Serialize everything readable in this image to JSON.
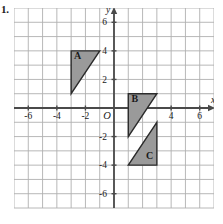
{
  "problem": {
    "number": "1."
  },
  "graph": {
    "type": "coordinate-plane",
    "origin_label": "O",
    "axis_labels": {
      "x": "x",
      "y": "y"
    },
    "x_axis": {
      "min": -7,
      "max": 7,
      "tick_labels": [
        "-6",
        "-4",
        "-2",
        "4",
        "6"
      ],
      "tick_values": [
        -6,
        -4,
        -2,
        4,
        6
      ],
      "hidden_tick_values": [
        2
      ]
    },
    "y_axis": {
      "min": -7,
      "max": 7,
      "tick_labels": [
        "6",
        "4",
        "2",
        "-2",
        "-4",
        "-6"
      ],
      "tick_values": [
        6,
        4,
        2,
        -2,
        -4,
        -6
      ]
    },
    "grid": {
      "visible": true,
      "spacing": 1,
      "color": "#b0b0b0"
    },
    "colors": {
      "grid": "#b0b0b0",
      "axis": "#4a4a4a",
      "shape_fill": "#9a9a9a",
      "shape_stroke": "#2b2b2b",
      "text": "#1a1a1a"
    },
    "shapes": [
      {
        "label": "A",
        "kind": "right-triangle",
        "vertices": [
          [
            -3,
            4
          ],
          [
            -1,
            4
          ],
          [
            -3,
            1
          ]
        ],
        "label_position": [
          -2.55,
          3.45
        ]
      },
      {
        "label": "B",
        "kind": "right-triangle",
        "vertices": [
          [
            1,
            1
          ],
          [
            3,
            1
          ],
          [
            1,
            -2
          ]
        ],
        "label_position": [
          1.45,
          0.45
        ]
      },
      {
        "label": "C",
        "kind": "right-triangle",
        "vertices": [
          [
            3,
            -1
          ],
          [
            3,
            -4
          ],
          [
            1,
            -4
          ]
        ],
        "label_position": [
          2.5,
          -3.55
        ]
      }
    ]
  }
}
